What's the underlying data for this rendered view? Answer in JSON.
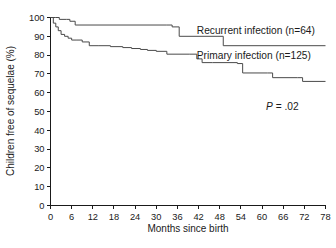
{
  "chart_data": {
    "type": "line",
    "title": "",
    "xlabel": "Months since birth",
    "ylabel": "Children free of sequelae (%)",
    "xlim": [
      0,
      78
    ],
    "ylim": [
      0,
      100
    ],
    "xticks": [
      0,
      6,
      12,
      18,
      24,
      30,
      36,
      42,
      48,
      54,
      60,
      66,
      72,
      78
    ],
    "yticks": [
      0,
      10,
      20,
      30,
      40,
      50,
      60,
      70,
      80,
      90,
      100
    ],
    "xtick_labels": [
      "0",
      "6",
      "12",
      "18",
      "24",
      "30",
      "36",
      "42",
      "48",
      "54",
      "60",
      "66",
      "72",
      "78"
    ],
    "ytick_labels": [
      "0",
      "10",
      "20",
      "30",
      "40",
      "50",
      "60",
      "70",
      "80",
      "90",
      "100"
    ],
    "grid": false,
    "legend_position": "inline-right",
    "step_style": "post",
    "annotations": [
      {
        "name": "p-value",
        "text": "P = .02",
        "x": 66,
        "y": 50,
        "italic_prefix": "P"
      }
    ],
    "series": [
      {
        "name": "Recurrent infection (n=64)",
        "label": "Recurrent infection (n=64)",
        "n": 64,
        "color": "#4a4a4a",
        "label_x": 41.5,
        "label_y": 93,
        "x": [
          0,
          1.5,
          2.5,
          4.5,
          5.5,
          7.0,
          33.0,
          34.5,
          36.5,
          47.5,
          49.0,
          78.0
        ],
        "y": [
          100,
          100,
          99,
          99,
          98,
          96,
          96,
          95,
          90,
          90,
          85,
          85
        ]
      },
      {
        "name": "Primary infection (n=125)",
        "label": "Primary infection (n=125)",
        "n": 125,
        "color": "#4a4a4a",
        "label_x": 41.5,
        "label_y": 80,
        "x": [
          0,
          0.8,
          1.5,
          2.2,
          3.0,
          4.0,
          5.0,
          6.0,
          7.5,
          9.0,
          11.0,
          13.5,
          17.0,
          20.5,
          23.0,
          25.5,
          27.5,
          30.0,
          33.0,
          39.5,
          41.5,
          43.0,
          46.0,
          53.0,
          54.5,
          61.5,
          63.0,
          70.0,
          71.5,
          78.0
        ],
        "y": [
          100,
          97,
          95,
          93,
          91,
          90,
          89,
          88,
          88,
          87,
          85,
          85,
          84.5,
          84,
          83.5,
          83,
          82.5,
          82,
          80.5,
          80.5,
          78,
          76,
          76,
          75.5,
          70.5,
          70.5,
          68,
          68,
          66,
          66
        ]
      }
    ]
  },
  "axis": {
    "y_title": "Children free of sequelae (%)",
    "x_title": "Months since birth"
  },
  "pvalue": {
    "italic": "P",
    "rest": " = .02"
  },
  "caption": {
    "cut_text": ""
  }
}
